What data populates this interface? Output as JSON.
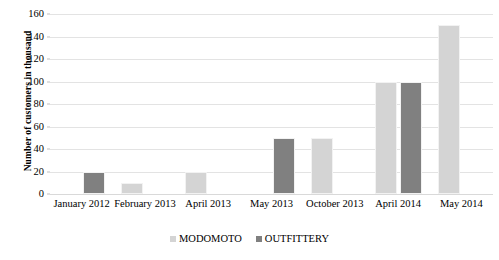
{
  "chart_data": {
    "type": "bar",
    "title": "",
    "xlabel": "",
    "ylabel": "Number of customers in thousand",
    "ylim": [
      0,
      160
    ],
    "ytick_step": 20,
    "yticks": [
      160,
      140,
      120,
      100,
      80,
      60,
      40,
      20,
      0
    ],
    "grid": true,
    "legend_position": "bottom-center",
    "categories": [
      "January 2012",
      "February 2013",
      "April 2013",
      "May 2013",
      "October 2013",
      "April 2014",
      "May 2014"
    ],
    "series": [
      {
        "name": "MODOMOTO",
        "color": "#d4d4d4",
        "values": [
          null,
          10,
          20,
          null,
          50,
          100,
          150
        ]
      },
      {
        "name": "OUTFITTERY",
        "color": "#808080",
        "values": [
          20,
          null,
          null,
          50,
          null,
          100,
          null
        ]
      }
    ]
  },
  "legend": {
    "items": [
      {
        "label": "MODOMOTO",
        "swatch_icon": "square-swatch-icon"
      },
      {
        "label": "OUTFITTERY",
        "swatch_icon": "square-swatch-icon"
      }
    ]
  }
}
